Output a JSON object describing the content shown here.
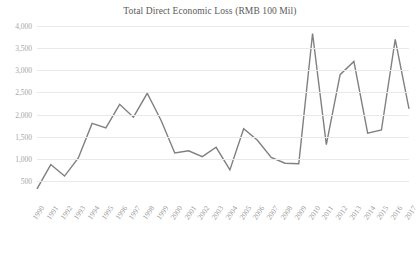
{
  "chart_data": {
    "type": "line",
    "title": "Total Direct Economic Loss (RMB 100 Mil)",
    "xlabel": "",
    "ylabel": "",
    "ylim": [
      250,
      4000
    ],
    "yticks": [
      "500",
      "1,000",
      "1,500",
      "2,000",
      "2,500",
      "3,000",
      "3,500",
      "4,000"
    ],
    "ytick_values": [
      500,
      1000,
      1500,
      2000,
      2500,
      3000,
      3500,
      4000
    ],
    "grid": true,
    "legend": "none",
    "line_color": "#808080",
    "categories": [
      "1990",
      "1991",
      "1992",
      "1993",
      "1994",
      "1995",
      "1996",
      "1997",
      "1998",
      "1999",
      "2000",
      "2001",
      "2002",
      "2003",
      "2004",
      "2005",
      "2006",
      "2007",
      "2008",
      "2009",
      "2010",
      "2011",
      "2012",
      "2013",
      "2014",
      "2015",
      "2016",
      "2017"
    ],
    "values": [
      320,
      870,
      610,
      1020,
      1800,
      1700,
      2230,
      1940,
      2480,
      1870,
      1130,
      1180,
      1050,
      1260,
      750,
      1680,
      1420,
      1030,
      900,
      890,
      3830,
      1320,
      2900,
      3200,
      1580,
      1650,
      3700,
      2130
    ],
    "series_name": "Total Direct Economic Loss"
  }
}
